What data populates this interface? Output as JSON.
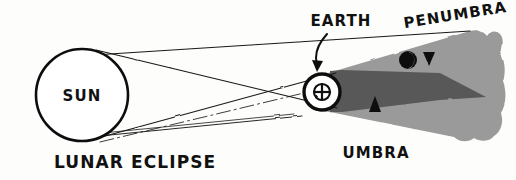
{
  "figure": {
    "title": "LUNAR ECLIPSE",
    "style": "hand-drawn ink sketch",
    "background_color": "#fdfdfb",
    "ink_color": "#111111"
  },
  "labels": {
    "sun": "SUN",
    "earth": "EARTH",
    "penumbra": "PENUMBRA",
    "umbra": "UMBRA",
    "caption": "LUNAR ECLIPSE"
  },
  "bodies": {
    "sun": {
      "name": "SUN",
      "cx": 82,
      "cy": 95,
      "r": 46,
      "fill": "#ffffff",
      "stroke": "#111111"
    },
    "earth": {
      "name": "EARTH",
      "cx": 322,
      "cy": 92,
      "r": 18,
      "symbol": "⊕",
      "fill": "#ffffff",
      "stroke": "#111111"
    },
    "moon": {
      "name": "MOON",
      "cx": 408,
      "cy": 60,
      "r": 9,
      "lit_side": "right",
      "dark_fill": "#111111",
      "lit_fill": "#ffffff"
    }
  },
  "shadows": {
    "penumbra": {
      "name": "PENUMBRA",
      "color": "#9a9a9a",
      "description": "light grey outer shadow cone widening to the right with a wavy hand-drawn outer edge"
    },
    "umbra": {
      "name": "UMBRA",
      "color": "#585858",
      "description": "dark grey inner shadow cone converging to a point"
    }
  },
  "annotations": [
    {
      "id": "earth-callout",
      "label": "EARTH",
      "text_x": 300,
      "text_y": 24,
      "arrow": "curved-down"
    },
    {
      "id": "penumbra-callout",
      "label": "PENUMBRA",
      "text_x": 398,
      "text_y": 20,
      "rotation": -9,
      "arrow": "straight-down"
    },
    {
      "id": "umbra-callout",
      "label": "UMBRA",
      "text_x": 348,
      "text_y": 160,
      "arrow": "straight-up"
    }
  ],
  "rays": {
    "count": 4,
    "description": "tangent light rays from the Sun limbs crossing past the Earth, plus a dash-dot optical axis",
    "stroke": "#1a1a1a"
  }
}
